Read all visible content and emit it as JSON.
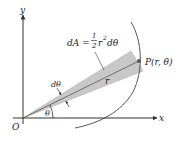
{
  "diagram": {
    "axes": {
      "x_label": "x",
      "y_label": "y",
      "origin_label": "O"
    },
    "area_element": {
      "lhs": "dA =",
      "fraction_numerator": "1",
      "fraction_denominator": "2",
      "rhs_base": "r",
      "rhs_exponent": "2",
      "rhs_tail": "dθ"
    },
    "point_label": "P(r, θ)",
    "radius_label": "r",
    "dtheta_label": "dθ",
    "theta_label": "θ",
    "colors": {
      "wedge_fill": "#c8c8c8",
      "wedge_edge": "#9a9a9a",
      "line": "#333333",
      "background": "#ffffff"
    }
  }
}
